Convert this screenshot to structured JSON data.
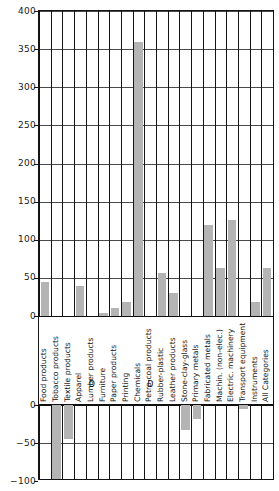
{
  "chart_data": {
    "type": "bar",
    "title": "",
    "subtitle": "",
    "xlabel": "",
    "ylabel": "",
    "ylim": [
      -100,
      400
    ],
    "grid": true,
    "legend": "none",
    "orientation": "vertical",
    "bar_color": "#b4b4b4",
    "axis_break_note": "Category labels are drawn in a band between the upper (0 to 400) and lower (0 to -100) panels; both panels share a zero baseline.",
    "yticks": [
      -100,
      -50,
      0,
      0,
      50,
      100,
      150,
      200,
      250,
      300,
      350,
      400
    ],
    "ytick_labels": [
      "-100",
      "-50",
      "0",
      "0",
      "50",
      "100",
      "150",
      "200",
      "250",
      "300",
      "350",
      "400"
    ],
    "categories": [
      "Food products",
      "Tobacco products",
      "Textile products",
      "Apparel",
      "Lumber products",
      "Furniture",
      "Paper products",
      "Printing",
      "Chemicals",
      "Petro-coal products",
      "Rubber-plastic",
      "Leather products",
      "Stone-clay-glass",
      "Primary metals",
      "Fabricated metals",
      "Machin. (non-elec.)",
      "Electric. machinery",
      "Transport equipment",
      "Instruments",
      "All Categories"
    ],
    "values": [
      45,
      -120,
      -45,
      40,
      null,
      4,
      11,
      18,
      359,
      null,
      56,
      30,
      -33,
      -18,
      120,
      63,
      126,
      -5,
      18,
      63
    ],
    "suppressed": [
      {
        "category": "Lumber products",
        "marker": "D"
      },
      {
        "category": "Petro-coal products",
        "marker": "D"
      }
    ],
    "notes": [
      "Tobacco products bar extends below the -100 axis limit (clipped).",
      "Lumber products and Petro-coal products values are withheld and marked 'D'."
    ]
  }
}
